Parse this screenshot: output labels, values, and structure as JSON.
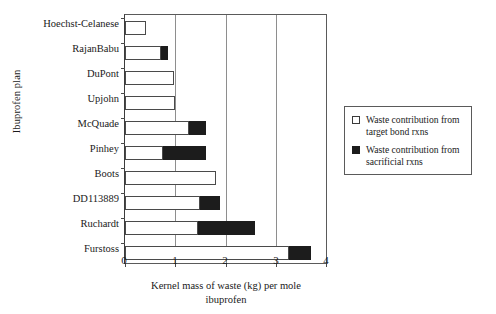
{
  "chart_data": {
    "type": "bar",
    "orientation": "horizontal",
    "stacked": true,
    "title": "",
    "xlabel_line1": "Kernel mass of waste (kg) per mole",
    "xlabel_line2": "ibuprofen",
    "ylabel": "Ibuprofen plan",
    "xlim": [
      0,
      4
    ],
    "xticks": [
      0,
      1,
      2,
      3,
      4
    ],
    "xtick_labels": [
      "0",
      "1",
      "2",
      "3",
      "4"
    ],
    "grid": "vertical",
    "legend_position": "right",
    "categories": [
      "Hoechst-Celanese",
      "RajanBabu",
      "DuPont",
      "Upjohn",
      "McQuade",
      "Pinhey",
      "Boots",
      "DD113889",
      "Ruchardt",
      "Furstoss"
    ],
    "series": [
      {
        "name": "Waste contribution from target bond rxns",
        "color": "#ffffff",
        "values": [
          0.42,
          0.72,
          0.98,
          1.0,
          1.28,
          0.75,
          1.81,
          1.5,
          1.46,
          3.26
        ]
      },
      {
        "name": "Waste contribution from sacrificial rxns",
        "color": "#1c1c1c",
        "values": [
          0.0,
          0.13,
          0.0,
          0.0,
          0.34,
          0.87,
          0.0,
          0.4,
          1.12,
          0.44
        ]
      }
    ],
    "totals": [
      0.42,
      0.85,
      0.98,
      1.0,
      1.62,
      1.62,
      1.81,
      1.9,
      2.58,
      3.7
    ]
  },
  "legend": {
    "items": [
      {
        "swatch": "white-square",
        "line1": "Waste contribution from",
        "line2": "target bond rxns"
      },
      {
        "swatch": "black-square",
        "line1": "Waste contribution from",
        "line2": "sacrificial rxns"
      }
    ]
  }
}
